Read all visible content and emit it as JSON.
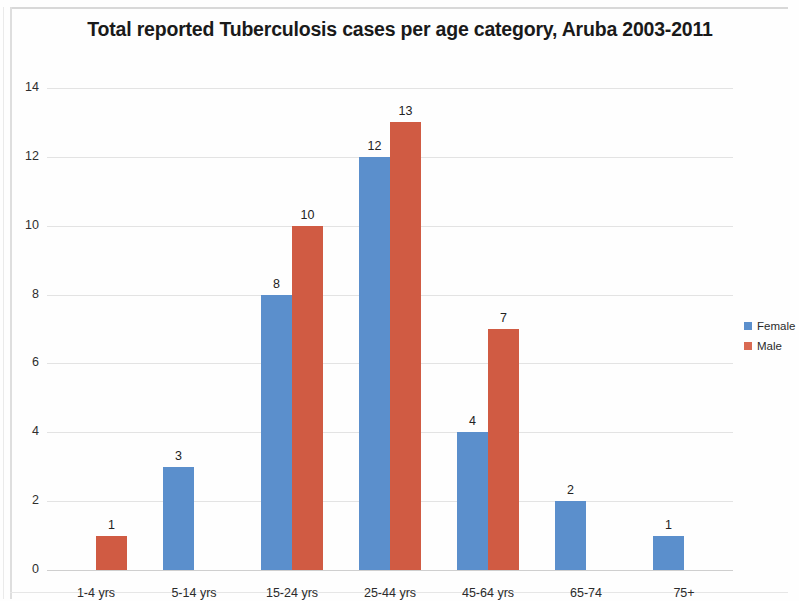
{
  "chart_data": {
    "type": "bar",
    "title": "Total reported Tuberculosis cases per age category, Aruba 2003-2011",
    "xlabel": "",
    "ylabel": "",
    "ylim": [
      0,
      14
    ],
    "ytick_step": 2,
    "yticks": [
      "0",
      "2",
      "4",
      "6",
      "8",
      "10",
      "12",
      "14"
    ],
    "grid": true,
    "legend_position": "right",
    "categories": [
      "1-4 yrs",
      "5-14 yrs",
      "15-24 yrs",
      "25-44 yrs",
      "45-64 yrs",
      "65-74",
      "75+"
    ],
    "series": [
      {
        "name": "Female",
        "color": "#5b8fcc",
        "values": [
          0,
          3,
          8,
          12,
          4,
          2,
          1
        ],
        "labels": [
          "",
          "3",
          "8",
          "12",
          "4",
          "2",
          "1"
        ]
      },
      {
        "name": "Male",
        "color": "#d05b43",
        "values": [
          1,
          0,
          10,
          13,
          7,
          0,
          0
        ],
        "labels": [
          "1",
          "",
          "10",
          "13",
          "7",
          "",
          ""
        ]
      }
    ]
  },
  "legend": {
    "items": [
      {
        "label": "Female",
        "swatch": "female"
      },
      {
        "label": "Male",
        "swatch": "male"
      }
    ]
  }
}
